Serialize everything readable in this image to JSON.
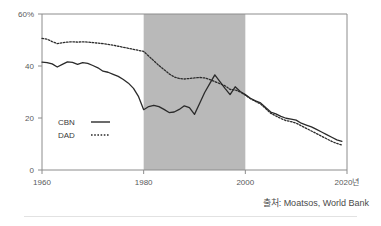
{
  "source": {
    "label": "출처: Moatsos, World Bank"
  },
  "chart_data": {
    "type": "line",
    "title": "",
    "xlabel": "",
    "ylabel": "",
    "xlim": [
      1960,
      2020
    ],
    "ylim": [
      0,
      60
    ],
    "grid": false,
    "legend_position": "inside-left",
    "x_tick_labels": [
      "1960",
      "1980",
      "2000",
      "2020년"
    ],
    "x_ticks": [
      1960,
      1980,
      2000,
      2020
    ],
    "y_tick_labels": [
      "60%",
      "40",
      "20",
      "0"
    ],
    "y_ticks": [
      60,
      40,
      20,
      0
    ],
    "shaded_region": {
      "x_start": 1980,
      "x_end": 2000,
      "color": "#b9b9b9"
    },
    "series": [
      {
        "name": "CBN",
        "style": "solid",
        "color": "#2b2b2b",
        "x": [
          1960,
          1961,
          1962,
          1963,
          1964,
          1965,
          1966,
          1967,
          1968,
          1969,
          1970,
          1971,
          1972,
          1973,
          1974,
          1975,
          1976,
          1977,
          1978,
          1979,
          1980,
          1981,
          1982,
          1983,
          1984,
          1985,
          1986,
          1987,
          1988,
          1989,
          1990,
          1991,
          1992,
          1993,
          1994,
          1995,
          1996,
          1997,
          1998,
          1999,
          2000,
          2001,
          2002,
          2003,
          2004,
          2005,
          2006,
          2007,
          2008,
          2009,
          2010,
          2011,
          2012,
          2013,
          2014,
          2015,
          2016,
          2017,
          2018,
          2019
        ],
        "values": [
          41.5,
          41.3,
          40.8,
          39.6,
          40.6,
          41.6,
          41.4,
          40.6,
          41.3,
          41.0,
          40.2,
          39.3,
          38.0,
          37.6,
          36.8,
          36.0,
          34.8,
          33.4,
          31.4,
          28.2,
          23.2,
          24.4,
          24.9,
          24.4,
          23.3,
          22.1,
          22.3,
          23.3,
          24.7,
          24.0,
          21.4,
          25.6,
          29.8,
          33.2,
          36.6,
          34.0,
          31.4,
          29.0,
          32.0,
          30.2,
          29.0,
          27.6,
          26.6,
          25.8,
          24.0,
          22.3,
          21.6,
          20.6,
          19.9,
          19.6,
          19.2,
          18.0,
          17.3,
          16.6,
          15.6,
          14.6,
          13.6,
          12.6,
          11.6,
          11.0
        ]
      },
      {
        "name": "DAD",
        "style": "dotted",
        "color": "#2b2b2b",
        "x": [
          1960,
          1961,
          1962,
          1963,
          1964,
          1965,
          1966,
          1967,
          1968,
          1969,
          1970,
          1971,
          1972,
          1973,
          1974,
          1975,
          1976,
          1977,
          1978,
          1979,
          1980,
          1981,
          1982,
          1983,
          1984,
          1985,
          1986,
          1987,
          1988,
          1989,
          1990,
          1991,
          1992,
          1993,
          1994,
          1995,
          1996,
          1997,
          1998,
          1999,
          2000,
          2001,
          2002,
          2003,
          2004,
          2005,
          2006,
          2007,
          2008,
          2009,
          2010,
          2011,
          2012,
          2013,
          2014,
          2015,
          2016,
          2017,
          2018,
          2019
        ],
        "values": [
          50.6,
          50.3,
          49.4,
          48.6,
          48.9,
          49.2,
          49.3,
          49.2,
          49.3,
          49.2,
          49.0,
          48.8,
          48.6,
          48.3,
          48.0,
          47.6,
          47.2,
          46.8,
          46.4,
          46.0,
          45.6,
          43.8,
          42.0,
          40.2,
          38.6,
          37.0,
          35.8,
          35.2,
          35.0,
          35.2,
          35.4,
          35.6,
          35.4,
          34.8,
          34.0,
          33.2,
          32.4,
          31.0,
          30.8,
          30.0,
          28.8,
          27.4,
          26.4,
          25.4,
          23.6,
          21.8,
          20.8,
          19.8,
          19.0,
          18.6,
          18.0,
          17.0,
          16.0,
          15.0,
          14.0,
          13.0,
          12.0,
          11.0,
          10.2,
          9.6
        ]
      }
    ],
    "legend_entries": [
      {
        "label": "CBN",
        "style": "solid"
      },
      {
        "label": "DAD",
        "style": "dotted"
      }
    ]
  }
}
